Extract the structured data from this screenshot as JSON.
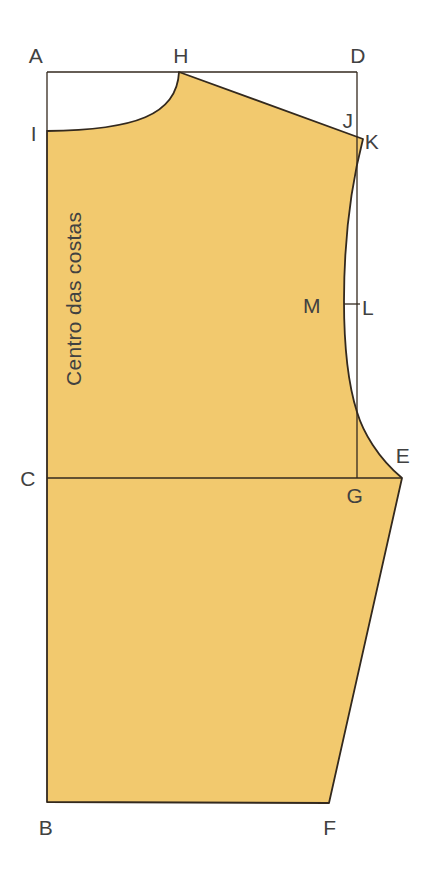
{
  "figure": {
    "type": "sewing-pattern-diagram",
    "side_text": "Centro das costas",
    "points": {
      "A": "A",
      "B": "B",
      "C": "C",
      "D": "D",
      "E": "E",
      "F": "F",
      "G": "G",
      "H": "H",
      "I": "I",
      "J": "J",
      "K": "K",
      "L": "L",
      "M": "M"
    },
    "colors": {
      "fill": "#F2C96E",
      "outline": "#33291E",
      "construction_line": "#33291E",
      "label": "#414141",
      "background": "#FFFFFF"
    },
    "paths": {
      "pattern_outline": "M 47 131 C 135 130 177 115 179 72 L 363 139 C 351 185 344 243 344 301 C 344 355 350 390 357 412 C 363 432 378 458 402 478 L 329 803 L 47 802 Z",
      "top_line": "M 47 72 L 357 72",
      "left_neck_line": "M 47 72 L 47 131",
      "armhole_depth_line": "M 357 72 L 357 478",
      "bust_line": "M 47 478 L 402 478",
      "ml_tick": "M 344 304 L 360 304"
    }
  }
}
